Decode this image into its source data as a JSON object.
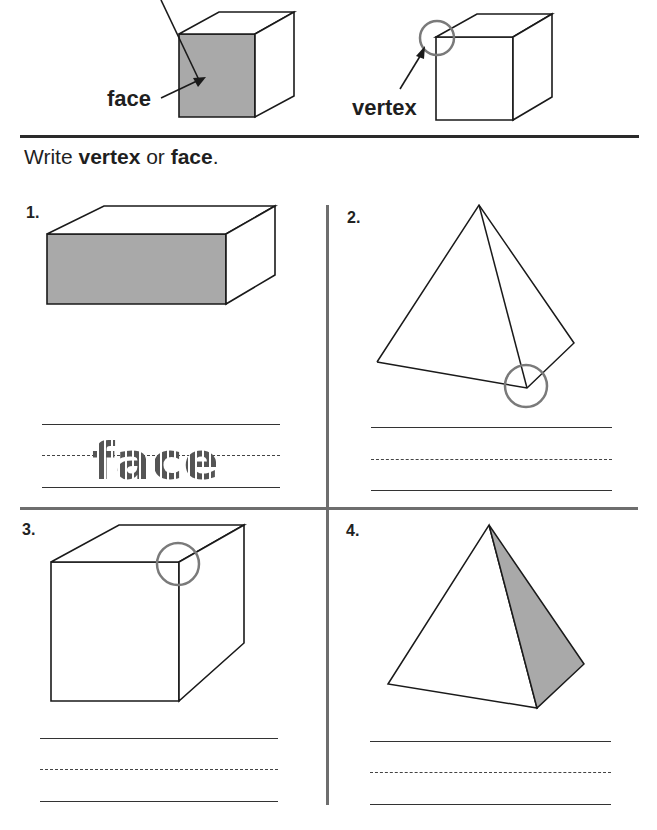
{
  "examples": {
    "face_label": "face",
    "vertex_label": "vertex"
  },
  "instruction": {
    "prefix": "Write ",
    "word1": "vertex",
    "middle": " or ",
    "word2": "face",
    "suffix": "."
  },
  "problems": [
    {
      "number": "1.",
      "shape": "rectangular prism",
      "highlight": "face (shaded front)",
      "answer_traced": "face"
    },
    {
      "number": "2.",
      "shape": "triangular pyramid",
      "highlight": "vertex (circled)",
      "answer_traced": ""
    },
    {
      "number": "3.",
      "shape": "cube",
      "highlight": "vertex (circled)",
      "answer_traced": ""
    },
    {
      "number": "4.",
      "shape": "triangular pyramid",
      "highlight": "face (shaded side)",
      "answer_traced": ""
    }
  ],
  "colors": {
    "shade": "#a9a9a9",
    "circle": "#7a7a7a",
    "ink": "#1a1a1a",
    "divider": "#6e6e6e"
  }
}
